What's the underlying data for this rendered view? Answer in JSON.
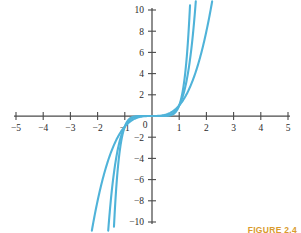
{
  "figure": {
    "caption": "FIGURE 2.4",
    "caption_color": "#d99b2e",
    "background_color": "#ffffff"
  },
  "chart_data": {
    "type": "line",
    "title": "",
    "subtitle": "",
    "xlabel": "",
    "ylabel": "",
    "xlim": [
      -5.6,
      5.6
    ],
    "ylim": [
      -11.0,
      11.0
    ],
    "grid": false,
    "legend": false,
    "legend_position": "none",
    "axis_color": "#4a4a4a",
    "curve_color": "#4fb3d9",
    "x_ticks": [
      -5,
      -4,
      -3,
      -2,
      -1,
      1,
      2,
      3,
      4,
      5
    ],
    "x_tick_labels": [
      "-5",
      "-4",
      "-3",
      "-2",
      "-1",
      "1",
      "2",
      "3",
      "4",
      "5"
    ],
    "y_ticks": [
      10,
      8,
      6,
      4,
      2,
      -2,
      -4,
      -6,
      -8,
      -10
    ],
    "y_tick_labels": [
      "10",
      "8",
      "6",
      "4",
      "2",
      "-2",
      "-4",
      "-6",
      "-8",
      "-10"
    ],
    "origin_label": "0",
    "series": [
      {
        "name": "y = x^3",
        "exponent": 3,
        "points_x": [
          -2.23,
          -2.0,
          -1.8,
          -1.6,
          -1.4,
          -1.2,
          -1.0,
          -0.8,
          -0.6,
          -0.4,
          -0.2,
          0.0,
          0.2,
          0.4,
          0.6,
          0.8,
          1.0,
          1.2,
          1.4,
          1.6,
          1.8,
          2.0,
          2.23
        ],
        "points_y": [
          -11.09,
          -8.0,
          -5.83,
          -4.1,
          -2.74,
          -1.73,
          -1.0,
          -0.51,
          -0.22,
          -0.06,
          -0.01,
          0.0,
          0.01,
          0.06,
          0.22,
          0.51,
          1.0,
          1.73,
          2.74,
          4.1,
          5.83,
          8.0,
          11.09
        ]
      },
      {
        "name": "y = x^5",
        "exponent": 5,
        "points_x": [
          -1.61,
          -1.5,
          -1.4,
          -1.3,
          -1.2,
          -1.1,
          -1.0,
          -0.8,
          -0.6,
          -0.4,
          -0.2,
          0.0,
          0.2,
          0.4,
          0.6,
          0.8,
          1.0,
          1.1,
          1.2,
          1.3,
          1.4,
          1.5,
          1.61
        ],
        "points_y": [
          -10.81,
          -7.59,
          -5.38,
          -3.71,
          -2.49,
          -1.61,
          -1.0,
          -0.33,
          -0.08,
          -0.01,
          0.0,
          0.0,
          0.0,
          0.01,
          0.08,
          0.33,
          1.0,
          1.61,
          2.49,
          3.71,
          5.38,
          7.59,
          10.81
        ]
      },
      {
        "name": "y = x^7",
        "exponent": 7,
        "points_x": [
          -1.41,
          -1.35,
          -1.3,
          -1.25,
          -1.2,
          -1.1,
          -1.0,
          -0.9,
          -0.7,
          -0.5,
          -0.3,
          0.0,
          0.3,
          0.5,
          0.7,
          0.9,
          1.0,
          1.1,
          1.2,
          1.25,
          1.3,
          1.35,
          1.41
        ],
        "points_y": [
          -10.95,
          -8.17,
          -6.27,
          -4.77,
          -3.58,
          -1.95,
          -1.0,
          -0.48,
          -0.08,
          -0.01,
          0.0,
          0.0,
          0.0,
          0.01,
          0.08,
          0.48,
          1.0,
          1.95,
          3.58,
          4.77,
          6.27,
          8.17,
          10.95
        ]
      }
    ]
  }
}
